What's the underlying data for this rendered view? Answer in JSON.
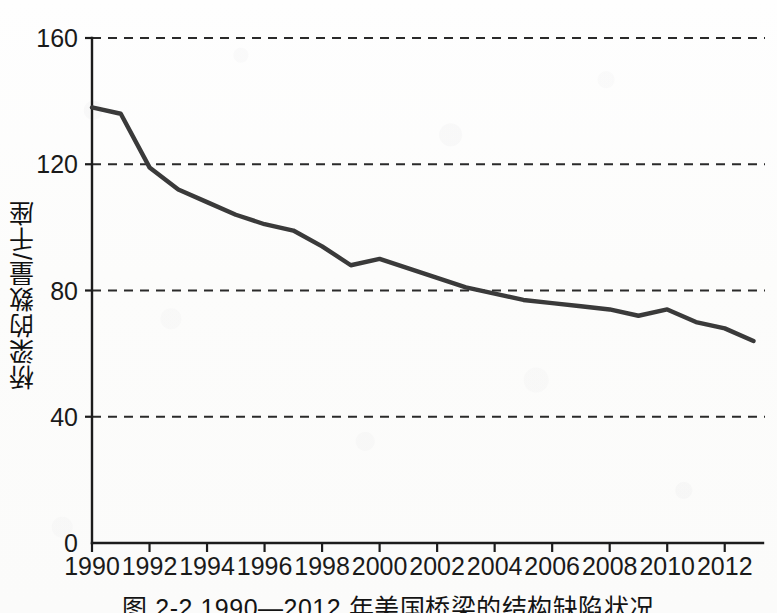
{
  "figure": {
    "caption": "图 2-2  1990—2012 年美国桥梁的结构缺陷状况",
    "y_axis_title": "桥梁的数量/千座"
  },
  "chart_data": {
    "type": "line",
    "title": "",
    "subtitle": "",
    "xlabel": "",
    "ylabel": "桥梁的数量/千座",
    "xlim": [
      1990,
      2013.4
    ],
    "ylim": [
      0,
      160
    ],
    "yticks": [
      0,
      40,
      80,
      120,
      160
    ],
    "ytick_labels": [
      "0",
      "40",
      "80",
      "120",
      "160"
    ],
    "xticks": [
      1990,
      1992,
      1994,
      1996,
      1998,
      2000,
      2002,
      2004,
      2006,
      2008,
      2010,
      2012
    ],
    "xtick_labels": [
      "1990",
      "1992",
      "1994",
      "1996",
      "1998",
      "2000",
      "2002",
      "2004",
      "2006",
      "2008",
      "2010",
      "2012"
    ],
    "grid": "horizontal-dashed",
    "legend": "none",
    "line_color": "#3a3a3a",
    "x": [
      1990,
      1991,
      1992,
      1993,
      1994,
      1995,
      1996,
      1997,
      1998,
      1999,
      2000,
      2001,
      2002,
      2003,
      2004,
      2005,
      2006,
      2007,
      2008,
      2009,
      2010,
      2011,
      2012,
      2013
    ],
    "values": [
      138,
      136,
      119,
      112,
      108,
      104,
      101,
      99,
      94,
      88,
      90,
      87,
      84,
      81,
      79,
      77,
      76,
      75,
      74,
      72,
      74,
      70,
      68,
      64
    ],
    "series": [
      {
        "name": "结构缺陷桥梁数量",
        "values": [
          138,
          136,
          119,
          112,
          108,
          104,
          101,
          99,
          94,
          88,
          90,
          87,
          84,
          81,
          79,
          77,
          76,
          75,
          74,
          72,
          74,
          70,
          68,
          64
        ]
      }
    ]
  }
}
